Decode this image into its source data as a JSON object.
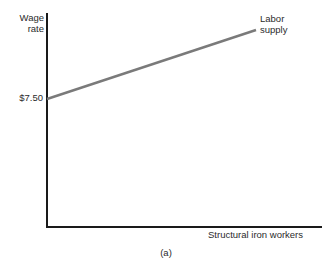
{
  "figure": {
    "caption": "(a)"
  },
  "chart_data": {
    "type": "line",
    "title": "",
    "subtitle": "",
    "xlabel": "Structural iron workers",
    "ylabel": "Wage rate",
    "ylabel_line1": "Wage",
    "ylabel_line2": "rate",
    "grid": false,
    "legend_position": "inline-right-end",
    "y_tick_labels": [
      "$7.50"
    ],
    "x_tick_labels": [],
    "annotations": [
      {
        "text": "Labor supply",
        "line1": "Labor",
        "line2": "supply",
        "attached_to": "labor-supply-series",
        "position": "end-of-line"
      }
    ],
    "series": [
      {
        "name": "Labor supply",
        "color": "#7a7a7a",
        "line_width": 2.4,
        "points": [
          {
            "x": 0,
            "y": 7.5
          },
          {
            "x": 100,
            "y": 14.9
          }
        ],
        "pixel_points": [
          {
            "x": 47,
            "y": 99
          },
          {
            "x": 256,
            "y": 30
          }
        ],
        "slope": "positive",
        "description": "Upward sloping labor supply curve starting at $7.50 on the wage-rate axis"
      }
    ],
    "axes": {
      "y_axis_color": "#1a1a1a",
      "x_axis_color": "#1a1a1a",
      "origin_pixel": {
        "x": 47,
        "y": 227
      },
      "y_axis_top_pixel": {
        "x": 47,
        "y": 13
      },
      "x_axis_right_pixel": {
        "x": 322,
        "y": 227
      }
    },
    "colors": {
      "series": "#7a7a7a",
      "axis": "#1a1a1a",
      "text": "#2b2b2b",
      "background": "#ffffff"
    }
  }
}
